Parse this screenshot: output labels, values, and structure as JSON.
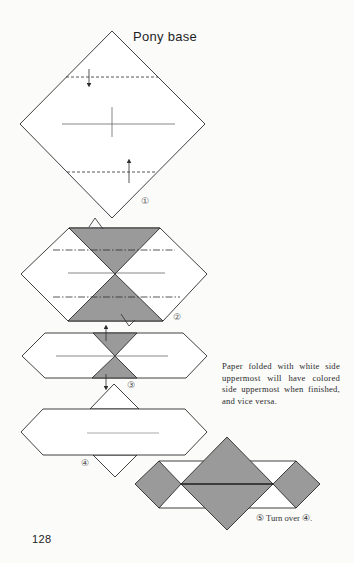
{
  "title": "Pony base",
  "page_number": "128",
  "steps": [
    {
      "id": 1,
      "label": "①"
    },
    {
      "id": 2,
      "label": "②"
    },
    {
      "id": 3,
      "label": "③"
    },
    {
      "id": 4,
      "label": "④"
    },
    {
      "id": 5,
      "label": "⑤"
    }
  ],
  "step5_caption": "⑤  Turn over ④.",
  "note": "Paper folded with white side uppermost will have colored side uppermost when finished, and vice versa.",
  "colors": {
    "paper_white": "#ffffff",
    "paper_colored": "#9a9a9a",
    "line": "#2b2b2b",
    "background": "#fbfbfa"
  },
  "legend": {
    "dashed_line": "valley fold",
    "dash_dot_line": "mountain fold",
    "thin_line": "crease"
  }
}
